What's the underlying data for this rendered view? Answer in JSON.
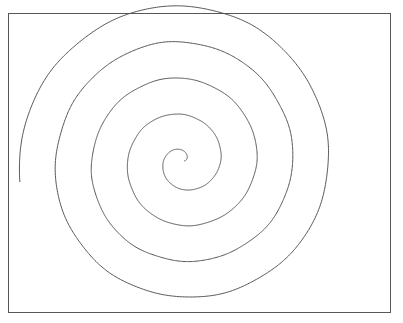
{
  "figure": {
    "title": "",
    "background_color": "#ffffff",
    "frame": {
      "name": "plot-border",
      "x": 8,
      "y": 13,
      "width": 383,
      "height": 300,
      "stroke_color": "#575757",
      "stroke_width": 1.4,
      "fill_color": "#ffffff"
    }
  },
  "chart_data": {
    "type": "line",
    "title": "",
    "subtitle": "",
    "xlabel": "",
    "ylabel": "",
    "grid": false,
    "legend_position": "none",
    "legend": [],
    "annotations": [],
    "tick_labels": {
      "x": [],
      "y": []
    },
    "xlim": [
      8,
      391
    ],
    "ylim": [
      13,
      313
    ],
    "series": [
      {
        "name": "archimedean-spiral",
        "curve_kind": "archimedean-spiral",
        "stroke_color": "#555555",
        "stroke_width": 1,
        "center": {
          "x": 183,
          "y": 161
        },
        "turns": 4.52,
        "radial_spacing_px": 36,
        "start_radius_px": 1.5,
        "end_radius_px": 153,
        "start_angle_deg": 0,
        "direction": "counterclockwise-outward",
        "end_point": {
          "x": 283,
          "y": 297
        },
        "extents": {
          "leftmost_x": 68,
          "rightmost_x": 334,
          "topmost_y": 33,
          "bottommost_y": 297
        },
        "horizontal_crossings_through_center": {
          "left_x": [
            69,
            112,
            141,
            163
          ],
          "right_x": [
            192,
            204,
            226,
            257,
            333
          ]
        }
      }
    ]
  }
}
